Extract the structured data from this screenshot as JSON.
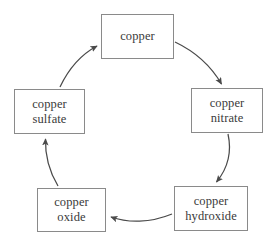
{
  "diagram": {
    "type": "cycle",
    "title": "",
    "nodes": [
      {
        "id": "copper",
        "lines": [
          "copper"
        ],
        "position": "top"
      },
      {
        "id": "copper-nitrate",
        "lines": [
          "copper",
          "nitrate"
        ],
        "position": "right"
      },
      {
        "id": "copper-hydroxide",
        "lines": [
          "copper",
          "hydroxide"
        ],
        "position": "bottom-right"
      },
      {
        "id": "copper-oxide",
        "lines": [
          "copper",
          "oxide"
        ],
        "position": "bottom-left"
      },
      {
        "id": "copper-sulfate",
        "lines": [
          "copper",
          "sulfate"
        ],
        "position": "left"
      }
    ],
    "edges": [
      {
        "from": "copper",
        "to": "copper-nitrate",
        "style": "curved-arrow"
      },
      {
        "from": "copper-nitrate",
        "to": "copper-hydroxide",
        "style": "curved-arrow"
      },
      {
        "from": "copper-hydroxide",
        "to": "copper-oxide",
        "style": "curved-arrow"
      },
      {
        "from": "copper-oxide",
        "to": "copper-sulfate",
        "style": "curved-arrow"
      },
      {
        "from": "copper-sulfate",
        "to": "copper",
        "style": "curved-arrow"
      }
    ],
    "colors": {
      "background": "#ffffff",
      "box_border": "#8a8a8a",
      "text": "#3a3a3a",
      "arrow": "#4a4a4a"
    }
  }
}
